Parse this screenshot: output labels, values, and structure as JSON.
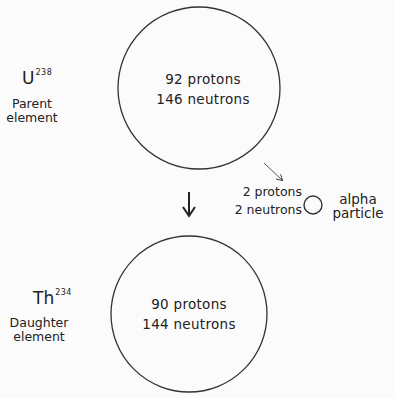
{
  "parent": {
    "symbol": "U",
    "mass_number": "238",
    "label_line1": "Parent",
    "label_line2": "element",
    "protons": "92 protons",
    "neutrons": "146 neutrons"
  },
  "daughter": {
    "symbol": "Th",
    "mass_number": "234",
    "label_line1": "Daughter",
    "label_line2": "element",
    "protons": "90 protons",
    "neutrons": "144 neutrons"
  },
  "alpha": {
    "protons": "2 protons",
    "neutrons": "2 neutrons",
    "label_line1": "alpha",
    "label_line2": "particle"
  },
  "colors": {
    "line": "#333333",
    "background": "#fbfbfb"
  }
}
